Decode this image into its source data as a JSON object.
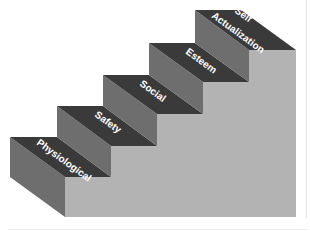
{
  "diagram": {
    "type": "staircase",
    "steps": [
      {
        "label": "Physiological",
        "level": 1
      },
      {
        "label": "Safety",
        "level": 2
      },
      {
        "label": "Social",
        "level": 3
      },
      {
        "label": "Esteem",
        "level": 4
      },
      {
        "label": "Self Actualization",
        "label_line1": "Self",
        "label_line2": "Actualization",
        "level": 5
      }
    ],
    "colors": {
      "tread": "#3a3a3a",
      "riser_side": "#6e6e6e",
      "front_face": "#b3b3b3",
      "label": "#ffffff",
      "background": "#ffffff"
    }
  }
}
